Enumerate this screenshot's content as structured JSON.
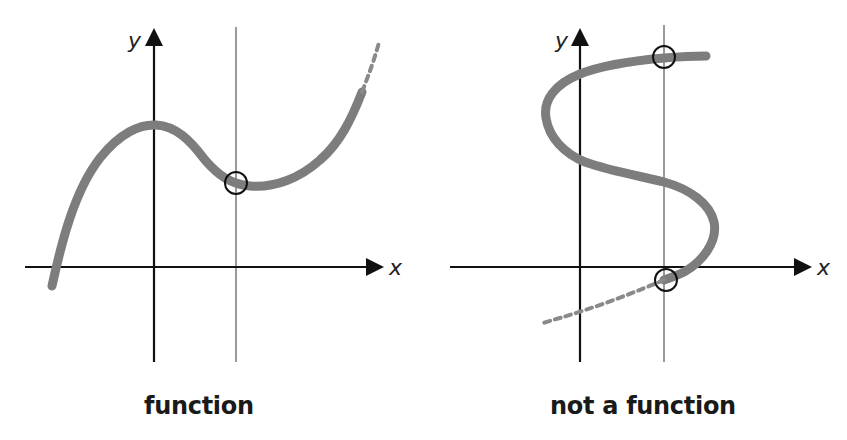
{
  "figure": {
    "panels": [
      {
        "id": "function",
        "caption": "function",
        "x_axis_label": "x",
        "y_axis_label": "y",
        "curve_type": "cubic-like curve",
        "test_line": "vertical line",
        "intersections": 1
      },
      {
        "id": "not-function",
        "caption": "not a function",
        "x_axis_label": "x",
        "y_axis_label": "y",
        "curve_type": "S-shaped curve",
        "test_line": "vertical line",
        "intersections": 2
      }
    ]
  },
  "colors": {
    "axis": "#111111",
    "curve": "#7d7d7d",
    "test_line": "#9a9a9a",
    "marker": "#111111",
    "background": "#ffffff"
  }
}
